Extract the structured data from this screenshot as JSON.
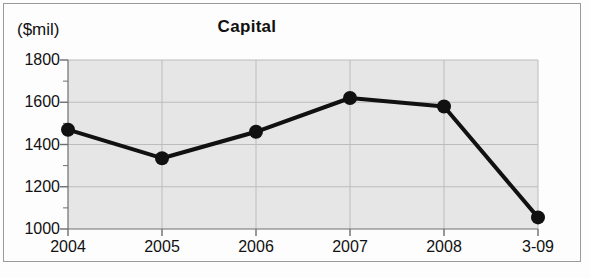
{
  "chart_data": {
    "type": "line",
    "title": "Capital",
    "xlabel": "",
    "ylabel": "($mil)",
    "categories": [
      "2004",
      "2005",
      "2006",
      "2007",
      "2008",
      "3-09"
    ],
    "values": [
      1470,
      1335,
      1460,
      1620,
      1580,
      1055
    ],
    "series": [
      {
        "name": "Capital",
        "values": [
          1470,
          1335,
          1460,
          1620,
          1580,
          1055
        ]
      }
    ],
    "ylim": [
      1000,
      1800
    ],
    "ytick_labels": [
      "1000",
      "1200",
      "1400",
      "1600",
      "1800"
    ],
    "ytick_values": [
      1000,
      1200,
      1400,
      1600,
      1800
    ],
    "minor_tick_interval": 100,
    "xtick_labels": [
      "2004",
      "2005",
      "2006",
      "2007",
      "2008",
      "3-09"
    ],
    "grid": true,
    "legend": "none",
    "marker": "filled-circle",
    "colors": {
      "line": "#111111",
      "marker": "#111111",
      "plot_background": "#e6e6e6",
      "grid": "#bcbcbc",
      "axis": "#6e6e6e",
      "frame": "#9a9a9a",
      "text": "#111111"
    }
  }
}
